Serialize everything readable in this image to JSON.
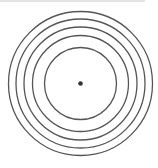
{
  "diagram": {
    "type": "concentric-circles",
    "center": {
      "x": 80.5,
      "y": 83.5
    },
    "ring_radii": [
      36,
      48,
      56.5,
      64.5,
      72
    ],
    "ring_color": "#555555",
    "ring_stroke_width": 1.3,
    "center_dot": {
      "radius": 2.3,
      "color": "#333333"
    },
    "background": "#ffffff",
    "top_rule_color": "#e4e4e4"
  }
}
